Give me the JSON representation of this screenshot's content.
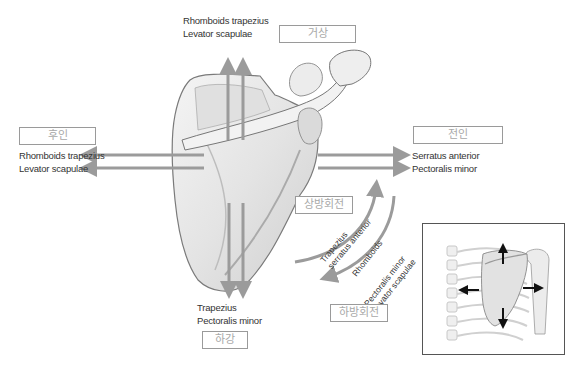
{
  "directions": {
    "elevation": {
      "label": "거상",
      "muscles": [
        "Rhomboids trapezius",
        "Levator scapulae"
      ]
    },
    "retraction": {
      "label": "후인",
      "muscles": [
        "Rhomboids trapezius",
        "Levator scapulae"
      ]
    },
    "protraction": {
      "label": "전인",
      "muscles": [
        "Serratus anterior",
        "Pectoralis minor"
      ]
    },
    "depression": {
      "label": "하강",
      "muscles": [
        "Trapezius",
        "Pectoralis minor"
      ]
    },
    "upward_rotation": {
      "label": "상방회전",
      "muscles": [
        "Trapezius",
        "serratus anterior"
      ]
    },
    "downward_rotation": {
      "label": "하방회전",
      "muscles": [
        "Rhomboids",
        "Pectoralis minor",
        "Levator scapulae"
      ]
    }
  },
  "colors": {
    "arrow": "#9b9b9b",
    "box_border": "#9a9a9a",
    "box_text": "#a8a8a8",
    "bone_fill": "#ebebeb",
    "bone_outline": "#7a7a7a"
  },
  "inset": {
    "description": "posterior view of scapula on rib cage with movement arrows"
  }
}
